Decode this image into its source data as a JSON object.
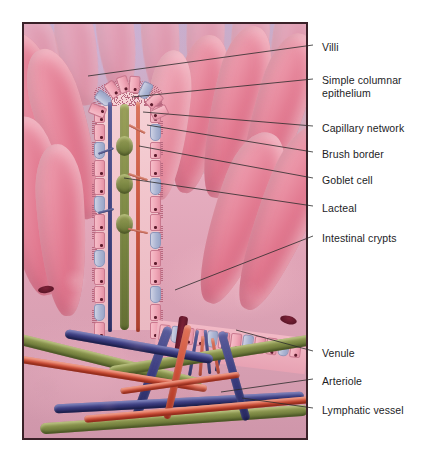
{
  "figure": {
    "type": "anatomical-illustration",
    "frame": {
      "x": 22,
      "y": 22,
      "width": 286,
      "height": 418
    },
    "background_color": "#ffffff",
    "border_color": "#3a2128"
  },
  "palette": {
    "lumen_background": "#c9b3d2",
    "villus_pink": "#e8899a",
    "villus_highlight": "#f3b9c4",
    "submucosa_pink": "#d9a0b0",
    "epithelial_cell": "#f0a8b8",
    "goblet_cell": "#aab4d2",
    "nucleus": "#5d1b2c",
    "lacteal_green": "#7e8a45",
    "venule_blue": "#3c3d80",
    "arteriole_red": "#cf4f38",
    "crypt_maroon": "#5a1527",
    "leader_line": "#2b2b2b",
    "label_text": "#1d1d1f"
  },
  "labels": [
    {
      "id": "villi",
      "text": "Villi",
      "x": 322,
      "y": 41,
      "leader": {
        "x1": 313,
        "y1": 45,
        "x2": 88,
        "y2": 76
      }
    },
    {
      "id": "simple-columnar",
      "text": "Simple columnar\nepithelium",
      "x": 322,
      "y": 74,
      "leader": {
        "x1": 313,
        "y1": 79,
        "x2": 132,
        "y2": 97
      }
    },
    {
      "id": "capillary-network",
      "text": "Capillary network",
      "x": 322,
      "y": 122,
      "leader": {
        "x1": 313,
        "y1": 126,
        "x2": 143,
        "y2": 112
      }
    },
    {
      "id": "brush-border",
      "text": "Brush border",
      "x": 322,
      "y": 148,
      "leader": {
        "x1": 313,
        "y1": 152,
        "x2": 147,
        "y2": 125
      }
    },
    {
      "id": "goblet-cell",
      "text": "Goblet cell",
      "x": 322,
      "y": 174,
      "leader": {
        "x1": 313,
        "y1": 178,
        "x2": 139,
        "y2": 146
      }
    },
    {
      "id": "lacteal",
      "text": "Lacteal",
      "x": 322,
      "y": 202,
      "leader": {
        "x1": 313,
        "y1": 206,
        "x2": 124,
        "y2": 178
      }
    },
    {
      "id": "intestinal-crypts",
      "text": "Intestinal crypts",
      "x": 322,
      "y": 232,
      "leader": {
        "x1": 313,
        "y1": 236,
        "x2": 175,
        "y2": 290
      }
    },
    {
      "id": "venule",
      "text": "Venule",
      "x": 322,
      "y": 347,
      "leader": {
        "x1": 313,
        "y1": 351,
        "x2": 236,
        "y2": 330
      }
    },
    {
      "id": "arteriole",
      "text": "Arteriole",
      "x": 322,
      "y": 375,
      "leader": {
        "x1": 313,
        "y1": 379,
        "x2": 221,
        "y2": 392
      }
    },
    {
      "id": "lymphatic-vessel",
      "text": "Lymphatic vessel",
      "x": 322,
      "y": 404,
      "leader": {
        "x1": 313,
        "y1": 408,
        "x2": 242,
        "y2": 398
      }
    }
  ],
  "structures": {
    "villi_count": 14,
    "cutaway_villus": {
      "description": "Longitudinally sectioned villus showing epithelium, lacteal and capillaries"
    },
    "vessels": [
      {
        "name": "lacteal",
        "color": "#7e8a45"
      },
      {
        "name": "venule",
        "color": "#3c3d80"
      },
      {
        "name": "arteriole",
        "color": "#cf4f38"
      },
      {
        "name": "lymphatic vessel",
        "color": "#7e8a45"
      }
    ],
    "crypts_visible": 3
  }
}
